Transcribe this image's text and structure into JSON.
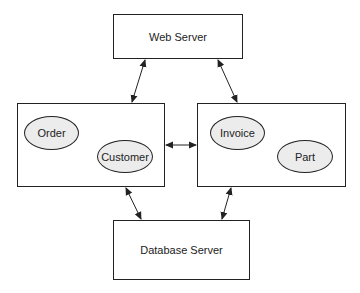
{
  "diagram": {
    "nodes": {
      "web_server": {
        "label": "Web Server"
      },
      "left_component": {
        "entities": [
          {
            "label": "Order"
          },
          {
            "label": "Customer"
          }
        ]
      },
      "right_component": {
        "entities": [
          {
            "label": "Invoice"
          },
          {
            "label": "Part"
          }
        ]
      },
      "database_server": {
        "label": "Database Server"
      }
    },
    "edges": [
      {
        "from": "web_server",
        "to": "left_component",
        "direction": "bidirectional"
      },
      {
        "from": "web_server",
        "to": "right_component",
        "direction": "bidirectional"
      },
      {
        "from": "left_component",
        "to": "right_component",
        "direction": "bidirectional"
      },
      {
        "from": "left_component",
        "to": "database_server",
        "direction": "bidirectional"
      },
      {
        "from": "right_component",
        "to": "database_server",
        "direction": "bidirectional"
      }
    ],
    "colors": {
      "stroke": "#222222",
      "oval_fill": "#ececec",
      "box_fill": "#ffffff"
    }
  }
}
